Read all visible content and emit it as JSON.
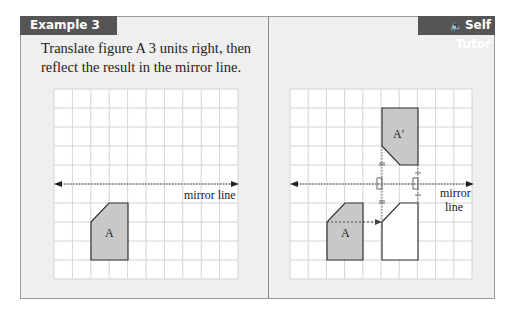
{
  "header": {
    "example_label": "Example 3",
    "self_tutor_label": "Self Tutor",
    "self_tutor_icon": "speaker-icon"
  },
  "question": {
    "text": "Translate figure A 3 units right, then reflect the result in the mirror line."
  },
  "left_diagram": {
    "grid": {
      "cols": 10,
      "rows": 10
    },
    "mirror_label": "mirror line",
    "shape_label": "A"
  },
  "right_diagram": {
    "grid": {
      "cols": 10,
      "rows": 10
    },
    "mirror_label_line1": "mirror",
    "mirror_label_line2": "line",
    "shape_label": "A",
    "image_label": "A′"
  },
  "colors": {
    "tab_bg": "#555555",
    "panel_bg": "#efefef",
    "shape_fill": "#c8c8c8",
    "grid_line": "#d0d0d0"
  }
}
